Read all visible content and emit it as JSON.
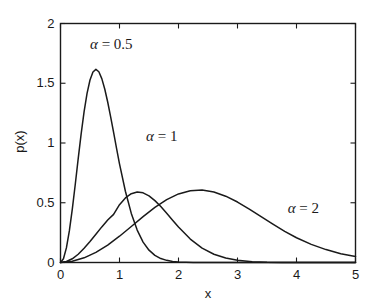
{
  "chart_data": {
    "type": "line",
    "title": "",
    "subtitle": "",
    "xlabel": "x",
    "ylabel": "p(x)",
    "xlim": [
      0,
      5
    ],
    "ylim": [
      0,
      2
    ],
    "grid": false,
    "legend_position": "inline-annotations",
    "xticks": [
      "0",
      "1",
      "2",
      "3",
      "4",
      "5"
    ],
    "xtick_values": [
      0,
      1,
      2,
      3,
      4,
      5
    ],
    "yticks": [
      "0",
      "0.5",
      "1",
      "1.5",
      "2"
    ],
    "ytick_values": [
      0,
      0.5,
      1,
      1.5,
      2
    ],
    "line_color": "#1a1a1a",
    "background_color": "#ffffff",
    "series": [
      {
        "name": "alpha = 0.5",
        "label": "α = 0.5",
        "alpha": 0.5,
        "peak_x": 0.5,
        "peak_y": 1.62,
        "x": [
          0,
          0.05,
          0.1,
          0.15,
          0.2,
          0.25,
          0.3,
          0.35,
          0.4,
          0.45,
          0.5,
          0.55,
          0.6,
          0.65,
          0.7,
          0.75,
          0.8,
          0.85,
          0.9,
          0.95,
          1.0,
          1.1,
          1.2,
          1.3,
          1.4,
          1.5,
          1.6,
          1.7,
          1.8,
          1.9,
          2.0,
          2.25,
          2.5,
          3.0,
          3.5,
          4.0,
          4.5,
          5.0
        ],
        "values": [
          0,
          0.031,
          0.122,
          0.264,
          0.446,
          0.653,
          0.869,
          1.077,
          1.263,
          1.416,
          1.527,
          1.594,
          1.616,
          1.596,
          1.539,
          1.452,
          1.343,
          1.219,
          1.088,
          0.955,
          0.826,
          0.596,
          0.411,
          0.271,
          0.171,
          0.103,
          0.06,
          0.033,
          0.018,
          0.009,
          0.004,
          0.001,
          0.0,
          0.0,
          0.0,
          0.0,
          0.0,
          0.0
        ]
      },
      {
        "name": "alpha = 1",
        "label": "α = 1",
        "alpha": 1,
        "peak_x": 1.0,
        "peak_y": 0.82,
        "x": [
          0,
          0.1,
          0.2,
          0.3,
          0.4,
          0.5,
          0.6,
          0.7,
          0.8,
          0.9,
          1.0,
          1.1,
          1.2,
          1.3,
          1.4,
          1.5,
          1.6,
          1.7,
          1.8,
          1.9,
          2.0,
          2.2,
          2.4,
          2.6,
          2.8,
          3.0,
          3.25,
          3.5,
          3.75,
          4.0,
          4.5,
          5.0
        ],
        "values": [
          0,
          0.008,
          0.031,
          0.069,
          0.12,
          0.176,
          0.237,
          0.298,
          0.355,
          0.403,
          0.484,
          0.54,
          0.576,
          0.59,
          0.583,
          0.558,
          0.518,
          0.468,
          0.412,
          0.354,
          0.297,
          0.196,
          0.12,
          0.069,
          0.037,
          0.018,
          0.007,
          0.002,
          0.001,
          0.0,
          0.0,
          0.0
        ]
      },
      {
        "name": "alpha = 2",
        "label": "α = 2",
        "alpha": 2,
        "peak_x": 2.0,
        "peak_y": 0.41,
        "x": [
          0,
          0.2,
          0.4,
          0.6,
          0.8,
          1.0,
          1.2,
          1.4,
          1.6,
          1.8,
          2.0,
          2.2,
          2.4,
          2.6,
          2.8,
          3.0,
          3.2,
          3.4,
          3.6,
          3.8,
          4.0,
          4.25,
          4.5,
          4.75,
          5.0
        ],
        "values": [
          0,
          0.01,
          0.039,
          0.085,
          0.146,
          0.22,
          0.301,
          0.384,
          0.461,
          0.526,
          0.574,
          0.601,
          0.606,
          0.59,
          0.555,
          0.506,
          0.447,
          0.384,
          0.321,
          0.261,
          0.207,
          0.152,
          0.108,
          0.074,
          0.05
        ]
      }
    ],
    "annotations": [
      {
        "text": "α = 0.5",
        "x": 0.5,
        "y": 1.82
      },
      {
        "text": "α = 1",
        "x": 1.45,
        "y": 1.05
      },
      {
        "text": "α = 2",
        "x": 3.85,
        "y": 0.45
      }
    ]
  }
}
